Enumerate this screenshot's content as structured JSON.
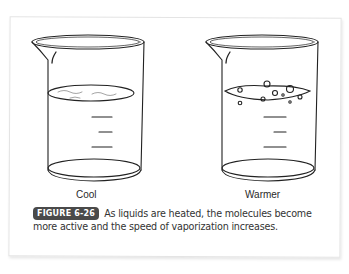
{
  "figure": {
    "badge": "FIGURE 6-26",
    "caption": "As liquids are heated, the molecules become more active and the speed of vaporization increases.",
    "beakers": [
      {
        "label": "Cool",
        "state": "calm liquid surface"
      },
      {
        "label": "Warmer",
        "state": "bubbling liquid surface"
      }
    ]
  }
}
